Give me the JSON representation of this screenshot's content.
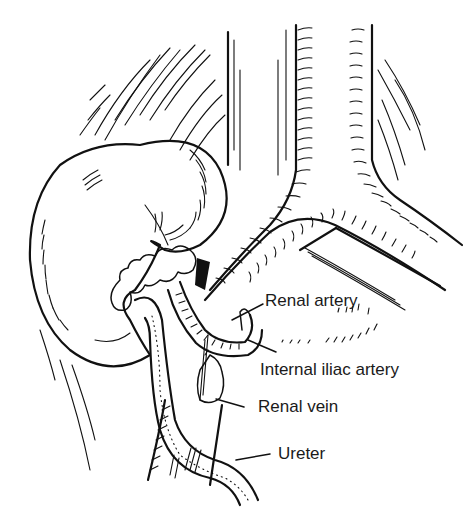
{
  "figure": {
    "type": "anatomical line drawing",
    "background": "#ffffff",
    "ink_color": "#111111"
  },
  "labels": [
    {
      "id": "renal-artery",
      "text": "Renal artery",
      "x": 265,
      "y": 292,
      "leader": {
        "x1": 263,
        "y1": 304,
        "x2": 232,
        "y2": 320
      }
    },
    {
      "id": "internal-iliac-artery",
      "text": "Internal iliac artery",
      "x": 260,
      "y": 361,
      "leader": {
        "x1": 276,
        "y1": 352,
        "x2": 248,
        "y2": 340
      }
    },
    {
      "id": "renal-vein",
      "text": "Renal vein",
      "x": 258,
      "y": 398,
      "leader": {
        "x1": 244,
        "y1": 407,
        "x2": 216,
        "y2": 399
      }
    },
    {
      "id": "ureter",
      "text": "Ureter",
      "x": 278,
      "y": 445,
      "leader": {
        "x1": 270,
        "y1": 454,
        "x2": 236,
        "y2": 460
      }
    }
  ]
}
